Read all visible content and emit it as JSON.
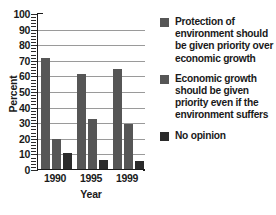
{
  "chart_data": {
    "type": "bar",
    "title": "",
    "xlabel": "Year",
    "ylabel": "Percent",
    "categories": [
      "1990",
      "1995",
      "1999"
    ],
    "ylim": [
      0,
      100
    ],
    "ytick_labels": [
      "0",
      "10",
      "20",
      "30",
      "40",
      "50",
      "60",
      "70",
      "80",
      "90",
      "100"
    ],
    "ytick_values": [
      0,
      10,
      20,
      30,
      40,
      50,
      60,
      70,
      80,
      90,
      100
    ],
    "grid": true,
    "grid_axis": "y",
    "legend_position": "right",
    "series": [
      {
        "name": "Protection of environment should be given priority over economic growth",
        "color": "#565656",
        "values": [
          71,
          61,
          64
        ]
      },
      {
        "name": "Economic growth should be given priority even if the environment suffers",
        "color": "#565656",
        "values": [
          19,
          32,
          29
        ]
      },
      {
        "name": "No opinion",
        "color": "#2b2b2b",
        "values": [
          10,
          6,
          5
        ]
      }
    ]
  },
  "legend": {
    "items": [
      {
        "swatch_icon": "legend-swatch-icon",
        "label": "Protection of environment should be given priority over economic growth"
      },
      {
        "swatch_icon": "legend-swatch-icon",
        "label": "Economic growth should be given priority even if the environment suffers"
      },
      {
        "swatch_icon": "legend-swatch-icon",
        "label": "No opinion"
      }
    ]
  },
  "axes": {
    "y_title": "Percent",
    "x_title": "Year"
  },
  "colors": {
    "bar_light": "#565656",
    "bar_dark": "#2b2b2b",
    "gridline": "#9a9a9a",
    "axis": "#1b1b1b",
    "text": "#1a1a1a",
    "background": "#ffffff"
  }
}
